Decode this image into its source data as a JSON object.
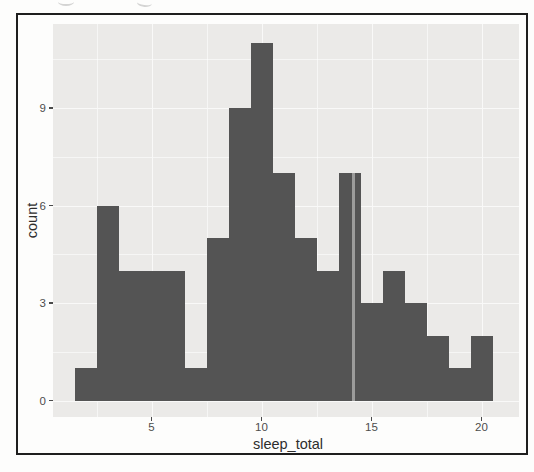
{
  "window": {
    "width": 534,
    "height": 472
  },
  "chart_data": {
    "type": "bar",
    "chart_kind": "histogram",
    "title": "",
    "xlabel": "sleep_total",
    "ylabel": "count",
    "legend": "none",
    "grid": "major and minor white gridlines on gray panel",
    "bin_width": 1,
    "bin_centers": [
      2,
      3,
      4,
      5,
      6,
      7,
      8,
      9,
      10,
      11,
      12,
      13,
      14,
      15,
      16,
      17,
      18,
      19,
      20
    ],
    "counts": [
      1,
      6,
      4,
      4,
      4,
      1,
      5,
      9,
      11,
      7,
      5,
      4,
      7,
      3,
      4,
      3,
      2,
      1,
      2
    ],
    "x_ticks": [
      5,
      10,
      15,
      20
    ],
    "y_ticks": [
      0,
      3,
      6,
      9
    ],
    "x_minor_gridlines": [
      2.5,
      7.5,
      12.5,
      17.5
    ],
    "y_minor_gridlines": [
      1.5,
      4.5,
      7.5,
      10.5
    ],
    "xlim": [
      0.55,
      21.7
    ],
    "ylim": [
      -0.5,
      11.6
    ],
    "colors": {
      "bar_fill": "#545454",
      "panel_background": "#ebeae8",
      "grid_major": "#f9f9f8",
      "grid_minor": "rgba(255,255,255,0.55)",
      "tick_text": "#4d4d4d",
      "axis_title_text": "#2d2d2d",
      "frame_border": "#1e1e1e",
      "outer_background": "#fdfdfc"
    }
  }
}
